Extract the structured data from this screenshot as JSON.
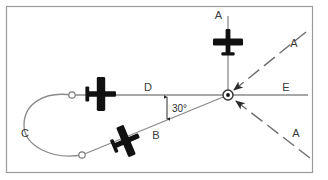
{
  "figure": {
    "background_color": "#ffffff",
    "frame_color": "#9a9a9a"
  },
  "station": {
    "name": "navaid-station",
    "x": 228,
    "y": 95,
    "ring_radius": 5,
    "dot_radius": 1.9
  },
  "labels": {
    "top_aircraft": "A",
    "upper_right_inbound": "A",
    "lower_right_inbound": "A",
    "outbound_leg": "D",
    "inbound_leg": "B",
    "turn_leg": "C",
    "holding_radial": "E",
    "angle": "30°"
  },
  "legs": [
    {
      "id": "D",
      "name": "outbound-leg-d",
      "label": "D",
      "label_x": 148,
      "label_y": 88,
      "from_x": 228,
      "from_y": 95,
      "to_x": 72,
      "to_y": 95,
      "style": "solid"
    },
    {
      "id": "B",
      "name": "inbound-leg-b",
      "label": "B",
      "label_x": 155,
      "label_y": 135,
      "from_x": 228,
      "from_y": 95,
      "to_x": 82,
      "to_y": 155,
      "style": "solid"
    },
    {
      "id": "C",
      "name": "turn-leg-c",
      "label": "C",
      "label_x": 24,
      "label_y": 132,
      "style": "arc"
    },
    {
      "id": "E",
      "name": "holding-radial-e",
      "label": "E",
      "label_x": 285,
      "label_y": 88,
      "from_x": 228,
      "from_y": 95,
      "to_x": 308,
      "to_y": 95,
      "style": "solid"
    }
  ],
  "inbound_tracks": [
    {
      "id": "A-upper",
      "name": "inbound-track-a-upper",
      "label": "A",
      "label_x": 292,
      "label_y": 44,
      "from_x": 306,
      "from_y": 32,
      "to_x": 232,
      "to_y": 91,
      "style": "dashed",
      "arrow": true
    },
    {
      "id": "A-lower",
      "name": "inbound-track-a-lower",
      "label": "A",
      "label_x": 292,
      "label_y": 136,
      "from_x": 310,
      "from_y": 158,
      "to_x": 234,
      "to_y": 100,
      "style": "dashed",
      "arrow": true
    }
  ],
  "aircraft": [
    {
      "id": "top",
      "name": "aircraft-symbol-top",
      "x": 228,
      "y": 42,
      "heading_deg": 180,
      "label": "A"
    },
    {
      "id": "outbound",
      "name": "aircraft-symbol-outbound",
      "x": 101,
      "y": 94,
      "heading_deg": 270,
      "label": "D"
    },
    {
      "id": "inbound",
      "name": "aircraft-symbol-inbound",
      "x": 126,
      "y": 141,
      "heading_deg": 247,
      "label": "B"
    }
  ],
  "fixes": [
    {
      "id": "fix-upper",
      "name": "turn-entry-fix",
      "x": 72,
      "y": 95,
      "r": 3.2
    },
    {
      "id": "fix-lower",
      "name": "turn-exit-fix",
      "x": 82,
      "y": 155,
      "r": 3.2
    }
  ],
  "angle_marker": {
    "name": "angle-30-marker",
    "text": "30°",
    "text_x": 175,
    "text_y": 112,
    "arrow_x": 166,
    "arrow_top_y": 96,
    "arrow_bottom_y": 120
  }
}
